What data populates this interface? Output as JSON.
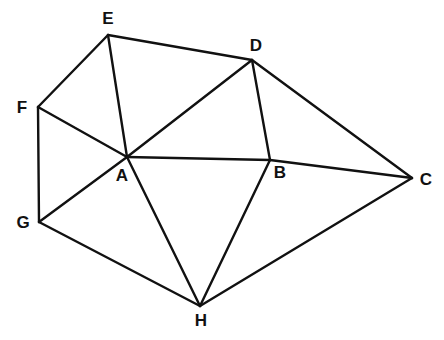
{
  "diagram": {
    "type": "graph",
    "vertices": [
      {
        "id": "E",
        "label": "E",
        "x": 108,
        "y": 35,
        "lx": 108,
        "ly": 20
      },
      {
        "id": "D",
        "label": "D",
        "x": 252,
        "y": 60,
        "lx": 256,
        "ly": 47
      },
      {
        "id": "F",
        "label": "F",
        "x": 38,
        "y": 107,
        "lx": 22,
        "ly": 109
      },
      {
        "id": "A",
        "label": "A",
        "x": 127,
        "y": 157,
        "lx": 122,
        "ly": 177
      },
      {
        "id": "B",
        "label": "B",
        "x": 270,
        "y": 160,
        "lx": 280,
        "ly": 174
      },
      {
        "id": "C",
        "label": "C",
        "x": 412,
        "y": 178,
        "lx": 426,
        "ly": 181
      },
      {
        "id": "G",
        "label": "G",
        "x": 39,
        "y": 222,
        "lx": 23,
        "ly": 224
      },
      {
        "id": "H",
        "label": "H",
        "x": 200,
        "y": 306,
        "lx": 201,
        "ly": 322
      }
    ],
    "edges": [
      [
        "E",
        "D"
      ],
      [
        "E",
        "F"
      ],
      [
        "E",
        "A"
      ],
      [
        "F",
        "A"
      ],
      [
        "F",
        "G"
      ],
      [
        "G",
        "A"
      ],
      [
        "G",
        "H"
      ],
      [
        "A",
        "H"
      ],
      [
        "A",
        "D"
      ],
      [
        "A",
        "B"
      ],
      [
        "D",
        "B"
      ],
      [
        "D",
        "C"
      ],
      [
        "B",
        "C"
      ],
      [
        "B",
        "H"
      ],
      [
        "H",
        "C"
      ]
    ],
    "colors": {
      "stroke": "#111111",
      "background": "#ffffff"
    }
  }
}
